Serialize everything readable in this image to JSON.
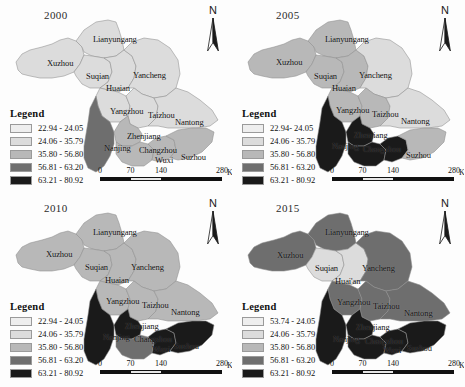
{
  "figure": {
    "panels": [
      {
        "id": "panel-2000",
        "year": "2000",
        "north_label": "N",
        "legend": {
          "title": "Legend",
          "rows": [
            {
              "label": "22.94 - 24.05",
              "color": "#eeeeee"
            },
            {
              "label": "24.06 - 35.79",
              "color": "#dcdcdc"
            },
            {
              "label": "35.80 - 56.80",
              "color": "#b8b8b8"
            },
            {
              "label": "56.81 - 63.20",
              "color": "#6e6e6e"
            },
            {
              "label": "63.21 - 80.92",
              "color": "#1a1a1a"
            }
          ]
        },
        "scalebar": {
          "ticks": [
            "0",
            "70",
            "140",
            "280"
          ],
          "unit": "Km"
        },
        "cities": [
          {
            "name": "Lianyungang",
            "x": 93,
            "y": 34
          },
          {
            "name": "Xuzhou",
            "x": 47,
            "y": 58
          },
          {
            "name": "Suqian",
            "x": 86,
            "y": 71
          },
          {
            "name": "Yancheng",
            "x": 133,
            "y": 70
          },
          {
            "name": "Huaian",
            "x": 106,
            "y": 83
          },
          {
            "name": "Yangzhou",
            "x": 110,
            "y": 106
          },
          {
            "name": "Taizhou",
            "x": 148,
            "y": 110
          },
          {
            "name": "Nantong",
            "x": 175,
            "y": 117
          },
          {
            "name": "Zhenjiang",
            "x": 127,
            "y": 131
          },
          {
            "name": "Nanjing",
            "x": 104,
            "y": 143
          },
          {
            "name": "Changzhou",
            "x": 139,
            "y": 145
          },
          {
            "name": "Wuxi",
            "x": 155,
            "y": 155
          },
          {
            "name": "Suzhou",
            "x": 181,
            "y": 152
          }
        ],
        "region_classes": {
          "xuzhou": "c2",
          "lianyungang": "c2",
          "suqian": "c2",
          "huaian": "c2",
          "yancheng": "c2",
          "yangzhou": "c2",
          "taizhou": "c2",
          "nantong": "c2",
          "nanjing": "c4",
          "zhenjiang": "c3",
          "changzhou": "c3",
          "wuxi": "c3",
          "suzhou": "c3"
        }
      },
      {
        "id": "panel-2005",
        "year": "2005",
        "north_label": "N",
        "legend": {
          "title": "Legend",
          "rows": [
            {
              "label": "22.94- 24.05",
              "color": "#eeeeee"
            },
            {
              "label": "24.06 - 35.79",
              "color": "#dcdcdc"
            },
            {
              "label": "35.80 - 56.80",
              "color": "#b8b8b8"
            },
            {
              "label": "56.81 - 63.20",
              "color": "#6e6e6e"
            },
            {
              "label": "63.21 - 80.92",
              "color": "#1a1a1a"
            }
          ]
        },
        "scalebar": {
          "ticks": [
            "0",
            "70",
            "140",
            "280"
          ],
          "unit": "Km"
        },
        "cities": [
          {
            "name": "Lianyungang",
            "x": 93,
            "y": 34
          },
          {
            "name": "Xuzhou",
            "x": 44,
            "y": 57
          },
          {
            "name": "Suqian",
            "x": 82,
            "y": 71
          },
          {
            "name": "Yancheng",
            "x": 127,
            "y": 70
          },
          {
            "name": "Huaian",
            "x": 100,
            "y": 83
          },
          {
            "name": "Yangzhou",
            "x": 104,
            "y": 105
          },
          {
            "name": "Taizhou",
            "x": 140,
            "y": 109
          },
          {
            "name": "Nantong",
            "x": 169,
            "y": 116
          },
          {
            "name": "Zhenjiang",
            "x": 122,
            "y": 130
          },
          {
            "name": "Nanjing",
            "x": 100,
            "y": 141
          },
          {
            "name": "Changzhou",
            "x": 131,
            "y": 144
          },
          {
            "name": "Suzhou",
            "x": 174,
            "y": 150
          }
        ],
        "region_classes": {
          "xuzhou": "c3",
          "lianyungang": "c3",
          "suqian": "c3",
          "huaian": "c3",
          "yancheng": "c2",
          "yangzhou": "c3",
          "taizhou": "c3",
          "nantong": "c2",
          "nanjing": "c5",
          "zhenjiang": "c5",
          "changzhou": "c5",
          "wuxi": "c5",
          "suzhou": "c3"
        }
      },
      {
        "id": "panel-2010",
        "year": "2010",
        "north_label": "N",
        "legend": {
          "title": "Legend",
          "rows": [
            {
              "label": "22.94 - 24.05",
              "color": "#eeeeee"
            },
            {
              "label": "24.06 - 35.79",
              "color": "#dcdcdc"
            },
            {
              "label": "35.80 - 56.80",
              "color": "#b8b8b8"
            },
            {
              "label": "56.81 - 63.20",
              "color": "#6e6e6e"
            },
            {
              "label": "63.21 - 80.92",
              "color": "#1a1a1a"
            }
          ]
        },
        "scalebar": {
          "ticks": [
            "0",
            "70",
            "140",
            "280"
          ],
          "unit": "Km"
        },
        "cities": [
          {
            "name": "Lianyungang",
            "x": 93,
            "y": 34
          },
          {
            "name": "Xuzhou",
            "x": 46,
            "y": 56
          },
          {
            "name": "Suqian",
            "x": 85,
            "y": 69
          },
          {
            "name": "Yancheng",
            "x": 131,
            "y": 69
          },
          {
            "name": "Huaian",
            "x": 105,
            "y": 82
          },
          {
            "name": "Yangzhou",
            "x": 106,
            "y": 103
          },
          {
            "name": "Taizhou",
            "x": 142,
            "y": 107
          },
          {
            "name": "Nantong",
            "x": 171,
            "y": 114
          },
          {
            "name": "Zhenjiang",
            "x": 125,
            "y": 128
          },
          {
            "name": "Nanjing",
            "x": 103,
            "y": 139
          },
          {
            "name": "Changzhou",
            "x": 134,
            "y": 141
          },
          {
            "name": "Wuxi",
            "x": 152,
            "y": 151
          },
          {
            "name": "Suzhou",
            "x": 174,
            "y": 148
          }
        ],
        "region_classes": {
          "xuzhou": "c3",
          "lianyungang": "c3",
          "suqian": "c3",
          "huaian": "c3",
          "yancheng": "c3",
          "yangzhou": "c3",
          "taizhou": "c3",
          "nantong": "c3",
          "nanjing": "c5",
          "zhenjiang": "c5",
          "changzhou": "c4",
          "wuxi": "c5",
          "suzhou": "c5"
        }
      },
      {
        "id": "panel-2015",
        "year": "2015",
        "north_label": "N",
        "legend": {
          "title": "Legend",
          "rows": [
            {
              "label": "53.74 - 24.05",
              "color": "#eeeeee"
            },
            {
              "label": "24.06 - 35.79",
              "color": "#dcdcdc"
            },
            {
              "label": "35.80 - 56.80",
              "color": "#b8b8b8"
            },
            {
              "label": "56.81 - 63.20",
              "color": "#6e6e6e"
            },
            {
              "label": "63.21 - 80.92",
              "color": "#1a1a1a"
            }
          ]
        },
        "scalebar": {
          "ticks": [
            "0",
            "70",
            "140",
            "280"
          ],
          "unit": "Km"
        },
        "cities": [
          {
            "name": "Lianyungang",
            "x": 93,
            "y": 34
          },
          {
            "name": "Xuzhou",
            "x": 45,
            "y": 57
          },
          {
            "name": "Suqian",
            "x": 83,
            "y": 70
          },
          {
            "name": "Yancheng",
            "x": 130,
            "y": 70
          },
          {
            "name": "Huai'an",
            "x": 103,
            "y": 83
          },
          {
            "name": "Yangzhou",
            "x": 105,
            "y": 104
          },
          {
            "name": "Taizhou",
            "x": 141,
            "y": 108
          },
          {
            "name": "Nantong",
            "x": 172,
            "y": 115
          },
          {
            "name": "Zhenjiang",
            "x": 124,
            "y": 129
          },
          {
            "name": "Nanjing",
            "x": 101,
            "y": 141
          },
          {
            "name": "Changzhou",
            "x": 133,
            "y": 143
          },
          {
            "name": "Wuxi",
            "x": 151,
            "y": 152
          },
          {
            "name": "Suzhou",
            "x": 175,
            "y": 150
          }
        ],
        "region_classes": {
          "xuzhou": "c4",
          "lianyungang": "c4",
          "suqian": "c2",
          "huaian": "c2",
          "yancheng": "c4",
          "yangzhou": "c4",
          "taizhou": "c4",
          "nantong": "c4",
          "nanjing": "c5",
          "zhenjiang": "c5",
          "changzhou": "c5",
          "wuxi": "c5",
          "suzhou": "c5"
        }
      }
    ]
  }
}
